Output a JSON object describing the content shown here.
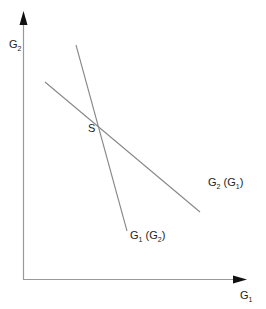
{
  "diagram": {
    "type": "reaction-function-diagram",
    "axes": {
      "y_label": "G",
      "y_label_sub": "2",
      "x_label": "G",
      "x_label_sub": "1"
    },
    "lines": [
      {
        "name": "G1 (G2)",
        "label_main": "G",
        "label_main_sub": "1",
        "label_paren": "G",
        "label_paren_sub": "2",
        "description": "steep downward-sloping line"
      },
      {
        "name": "G2 (G1)",
        "label_main": "G",
        "label_main_sub": "2",
        "label_paren": "G",
        "label_paren_sub": "1",
        "description": "shallow downward-sloping line"
      }
    ],
    "intersection": {
      "label": "S"
    },
    "colors": {
      "axis": "#999999",
      "line": "#888888",
      "text": "#222222",
      "arrow": "#111111"
    }
  }
}
